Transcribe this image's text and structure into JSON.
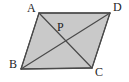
{
  "figure": {
    "kind": "geometry-diagram",
    "shape_name": "parallelogram",
    "canvas": {
      "width": 129,
      "height": 82
    },
    "style": {
      "background_color": "#ffffff",
      "fill_color": "#c9c9c9",
      "stroke_color": "#4a4a4a",
      "label_color": "#1d1d1d",
      "stroke_width": 1.2
    },
    "vertices": [
      {
        "id": "A",
        "label": "A",
        "x": 39,
        "y": 13,
        "label_x": 27,
        "label_y": 2
      },
      {
        "id": "D",
        "label": "D",
        "x": 110,
        "y": 13,
        "label_x": 113,
        "label_y": 1
      },
      {
        "id": "C",
        "label": "C",
        "x": 92,
        "y": 68,
        "label_x": 95,
        "label_y": 66
      },
      {
        "id": "B",
        "label": "B",
        "x": 21,
        "y": 69,
        "label_x": 9,
        "label_y": 58
      }
    ],
    "intersection": {
      "id": "P",
      "label": "P",
      "x": 58,
      "y": 37,
      "label_x": 57,
      "label_y": 21,
      "description": "intersection of diagonals"
    },
    "outline_path": "M 39 13 L 110 13 L 92 68 L 21 69 Z",
    "edges": [
      {
        "from": "A",
        "to": "D",
        "path": "M 39 13 L 110 13"
      },
      {
        "from": "D",
        "to": "C",
        "path": "M 110 13 L 92 68"
      },
      {
        "from": "C",
        "to": "B",
        "path": "M 92 68 L 21 69"
      },
      {
        "from": "B",
        "to": "A",
        "path": "M 21 69 L 39 13"
      }
    ],
    "diagonals": [
      {
        "from": "A",
        "to": "C",
        "path": "M 39 13 L 92 68"
      },
      {
        "from": "B",
        "to": "D",
        "path": "M 21 69 L 110 13"
      }
    ]
  }
}
